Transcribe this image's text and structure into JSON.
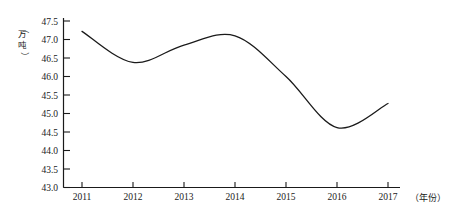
{
  "chart_data": {
    "type": "line",
    "title": "",
    "subtitle": "",
    "xlabel": "（年份）",
    "ylabel": "（万吨）",
    "xlim": [
      2010.7,
      2017.3
    ],
    "ylim": [
      43.0,
      47.5
    ],
    "grid": false,
    "legend": "none",
    "line_color": "#1a1a1a",
    "categories": [
      "2011",
      "2012",
      "2013",
      "2014",
      "2015",
      "2016",
      "2017"
    ],
    "x": [
      2011,
      2012,
      2013,
      2014,
      2015,
      2016,
      2017
    ],
    "values": [
      47.22,
      46.38,
      46.85,
      47.1,
      46.0,
      44.62,
      45.27
    ],
    "series": [
      {
        "name": "产量",
        "values": [
          47.22,
          46.38,
          46.85,
          47.1,
          46.0,
          44.62,
          45.27
        ]
      }
    ],
    "annotations": {
      "local_max": {
        "x": 2013.7,
        "y": 47.18
      },
      "local_min_1": {
        "x": 2012.05,
        "y": 46.38
      },
      "local_min_2": {
        "x": 2016.1,
        "y": 44.62
      },
      "start": {
        "x": 2011,
        "y": 47.22
      },
      "end": {
        "x": 2017,
        "y": 45.27
      }
    },
    "yticks": [
      "47.5",
      "47.0",
      "46.5",
      "46.0",
      "45.5",
      "45.0",
      "44.5",
      "44.0",
      "43.5",
      "43.0"
    ],
    "ytick_values": [
      47.5,
      47.0,
      46.5,
      46.0,
      45.5,
      45.0,
      44.5,
      44.0,
      43.5,
      43.0
    ],
    "xticks": [
      "2011",
      "2012",
      "2013",
      "2014",
      "2015",
      "2016",
      "2017"
    ],
    "ylabel_chars": [
      "（",
      "万",
      "吨",
      "）"
    ]
  }
}
